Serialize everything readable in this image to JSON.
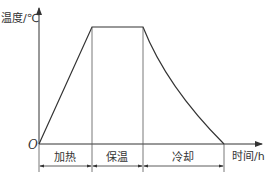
{
  "diagram": {
    "title": "",
    "y_axis_label": "温度/℃",
    "x_axis_label": "时间/h",
    "origin_label": "O",
    "phases": [
      {
        "label": "加热",
        "shape": "linear-rise"
      },
      {
        "label": "保温",
        "shape": "constant"
      },
      {
        "label": "冷却",
        "shape": "concave-decay"
      }
    ],
    "colors": {
      "line": "#333333",
      "background": "#ffffff"
    }
  }
}
